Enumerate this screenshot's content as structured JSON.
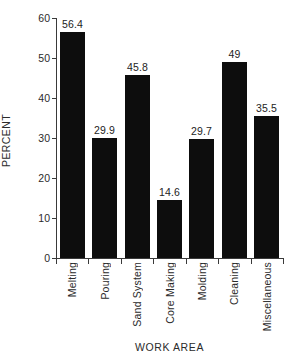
{
  "chart_data": {
    "type": "bar",
    "title": "",
    "xlabel": "WORK AREA",
    "ylabel": "PERCENT",
    "categories": [
      "Melting",
      "Pouring",
      "Sand System",
      "Core Making",
      "Molding",
      "Cleaning",
      "Miscellaneous"
    ],
    "values": [
      56.4,
      29.9,
      45.8,
      14.6,
      29.7,
      49,
      35.5
    ],
    "value_labels": [
      "56.4",
      "29.9",
      "45.8",
      "14.6",
      "29.7",
      "49",
      "35.5"
    ],
    "ylim": [
      0,
      60
    ],
    "yticks": [
      0,
      10,
      20,
      30,
      40,
      50,
      60
    ],
    "ytick_labels": [
      "0",
      "10",
      "20",
      "30",
      "40",
      "50",
      "60"
    ],
    "grid": false,
    "legend": false,
    "bar_color": "#0d0d0d",
    "axis_color": "#3a3a3a",
    "background": "#ffffff"
  }
}
